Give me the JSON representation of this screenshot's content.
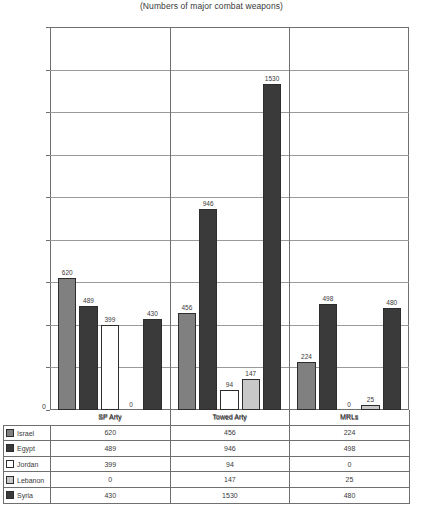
{
  "chart_data": {
    "type": "bar",
    "title": "(Numbers of major combat weapons)",
    "xlabel": "",
    "ylabel": "",
    "ylim": [
      0,
      1800
    ],
    "ytick_step": 200,
    "yticks": [
      "0",
      "200",
      "400",
      "600",
      "800",
      "1,000",
      "1,200",
      "1,400",
      "1,600",
      "1,800"
    ],
    "grid": true,
    "legend_position": "bottom-table",
    "categories": [
      "SP Arty",
      "Towed Arty",
      "MRLs"
    ],
    "series": [
      {
        "name": "Israel",
        "color": "#808080",
        "values": [
          620,
          456,
          224
        ]
      },
      {
        "name": "Egypt",
        "color": "#3a3a3a",
        "values": [
          489,
          946,
          498
        ]
      },
      {
        "name": "Jordan",
        "color": "#ffffff",
        "values": [
          399,
          94,
          0
        ]
      },
      {
        "name": "Lebanon",
        "color": "#c8c8c8",
        "values": [
          0,
          147,
          25
        ]
      },
      {
        "name": "Syria",
        "color": "#3a3a3a",
        "values": [
          430,
          1530,
          480
        ]
      }
    ]
  },
  "table": {
    "header": [
      "",
      "SP Arty",
      "Towed Arty",
      "MRLs"
    ],
    "rows": [
      {
        "label": "Israel",
        "values": [
          "620",
          "456",
          "224"
        ]
      },
      {
        "label": "Egypt",
        "values": [
          "489",
          "946",
          "498"
        ]
      },
      {
        "label": "Jordan",
        "values": [
          "399",
          "94",
          "0"
        ]
      },
      {
        "label": "Lebanon",
        "values": [
          "0",
          "147",
          "25"
        ]
      },
      {
        "label": "Syria",
        "values": [
          "430",
          "1530",
          "480"
        ]
      }
    ]
  }
}
